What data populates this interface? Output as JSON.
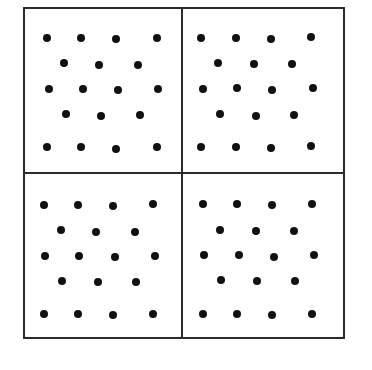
{
  "figure": {
    "colors": {
      "line": "#2a2a2a",
      "dot": "#111111",
      "background": "#ffffff"
    },
    "frame": {
      "left": 23,
      "top": 7,
      "right": 345,
      "bottom": 339
    },
    "divider": {
      "x": 182,
      "y": 173
    },
    "panels": [
      {
        "id": "top-left",
        "dots": [
          [
            47,
            38
          ],
          [
            81,
            38
          ],
          [
            116,
            39
          ],
          [
            157,
            38
          ],
          [
            64,
            63
          ],
          [
            99,
            65
          ],
          [
            138,
            65
          ],
          [
            49,
            89
          ],
          [
            83,
            89
          ],
          [
            118,
            90
          ],
          [
            158,
            89
          ],
          [
            66,
            114
          ],
          [
            101,
            116
          ],
          [
            140,
            115
          ],
          [
            47,
            147
          ],
          [
            81,
            147
          ],
          [
            116,
            149
          ],
          [
            157,
            147
          ]
        ]
      },
      {
        "id": "top-right",
        "dots": [
          [
            201,
            38
          ],
          [
            236,
            38
          ],
          [
            271,
            39
          ],
          [
            311,
            37
          ],
          [
            218,
            63
          ],
          [
            254,
            64
          ],
          [
            292,
            64
          ],
          [
            203,
            89
          ],
          [
            237,
            88
          ],
          [
            272,
            90
          ],
          [
            313,
            88
          ],
          [
            220,
            114
          ],
          [
            256,
            116
          ],
          [
            294,
            115
          ],
          [
            201,
            147
          ],
          [
            236,
            147
          ],
          [
            271,
            148
          ],
          [
            311,
            146
          ]
        ]
      },
      {
        "id": "bottom-left",
        "dots": [
          [
            44,
            205
          ],
          [
            78,
            205
          ],
          [
            113,
            206
          ],
          [
            153,
            204
          ],
          [
            61,
            230
          ],
          [
            96,
            232
          ],
          [
            135,
            232
          ],
          [
            45,
            256
          ],
          [
            79,
            256
          ],
          [
            115,
            257
          ],
          [
            155,
            256
          ],
          [
            62,
            281
          ],
          [
            98,
            282
          ],
          [
            136,
            282
          ],
          [
            44,
            314
          ],
          [
            78,
            314
          ],
          [
            113,
            315
          ],
          [
            153,
            314
          ]
        ]
      },
      {
        "id": "bottom-right",
        "dots": [
          [
            203,
            204
          ],
          [
            237,
            204
          ],
          [
            272,
            205
          ],
          [
            312,
            204
          ],
          [
            220,
            230
          ],
          [
            256,
            231
          ],
          [
            294,
            231
          ],
          [
            204,
            255
          ],
          [
            239,
            255
          ],
          [
            274,
            257
          ],
          [
            314,
            255
          ],
          [
            221,
            280
          ],
          [
            257,
            281
          ],
          [
            295,
            281
          ],
          [
            203,
            314
          ],
          [
            237,
            314
          ],
          [
            272,
            315
          ],
          [
            312,
            314
          ]
        ]
      }
    ]
  }
}
